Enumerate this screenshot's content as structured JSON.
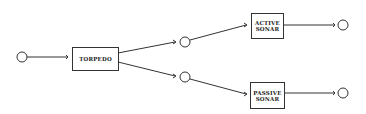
{
  "diagram": {
    "nodes": {
      "torpedo": {
        "label": "TORPEDO"
      },
      "active_sonar": {
        "line1": "ACTIVE",
        "line2": "SONAR"
      },
      "passive_sonar": {
        "line1": "PASSIVE",
        "line2": "SONAR"
      }
    },
    "colors": {
      "stroke": "#333333",
      "background": "#ffffff"
    }
  }
}
